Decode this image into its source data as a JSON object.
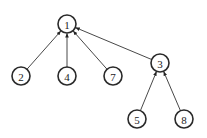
{
  "diagram": {
    "type": "tree",
    "direction": "child-to-parent arrows",
    "nodes": [
      {
        "id": "1",
        "label": "1",
        "x": 67,
        "y": 24
      },
      {
        "id": "2",
        "label": "2",
        "x": 21,
        "y": 76
      },
      {
        "id": "4",
        "label": "4",
        "x": 67,
        "y": 76
      },
      {
        "id": "7",
        "label": "7",
        "x": 113,
        "y": 76
      },
      {
        "id": "3",
        "label": "3",
        "x": 160,
        "y": 63
      },
      {
        "id": "5",
        "label": "5",
        "x": 137,
        "y": 119
      },
      {
        "id": "8",
        "label": "8",
        "x": 184,
        "y": 119
      }
    ],
    "edges": [
      {
        "from": "2",
        "to": "1"
      },
      {
        "from": "4",
        "to": "1"
      },
      {
        "from": "7",
        "to": "1"
      },
      {
        "from": "3",
        "to": "1"
      },
      {
        "from": "5",
        "to": "3"
      },
      {
        "from": "8",
        "to": "3"
      }
    ],
    "node_radius": 9,
    "colors": {
      "stroke": "#2a2a2a",
      "fill": "#ffffff",
      "edge": "#333333"
    }
  }
}
